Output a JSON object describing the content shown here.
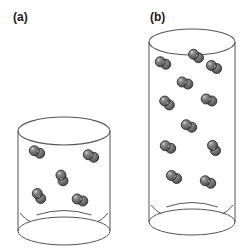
{
  "figure": {
    "title": "",
    "background_color": "#ffffff",
    "stroke_color": "#555555",
    "molecule_fill_dark": "#5f5f5f",
    "molecule_fill_light": "#8e8e8e",
    "molecule_outline": "#2b2b2b",
    "label_color": "#1a1a1a"
  },
  "panels": [
    {
      "id": "a",
      "label": "(a)",
      "name": "short-cylinder",
      "molecule_count": 5,
      "cylinder": {
        "cx": 64,
        "top_y": 131,
        "bottom_y": 231,
        "rx": 46,
        "ry": 14,
        "height": 100
      },
      "molecules": [
        {
          "x": 37,
          "y": 152,
          "angle": 25
        },
        {
          "x": 91,
          "y": 156,
          "angle": 25
        },
        {
          "x": 62,
          "y": 178,
          "angle": 70
        },
        {
          "x": 39,
          "y": 196,
          "angle": 55
        },
        {
          "x": 80,
          "y": 200,
          "angle": 20
        }
      ]
    },
    {
      "id": "b",
      "label": "(b)",
      "name": "tall-cylinder",
      "molecule_count": 11,
      "cylinder": {
        "cx": 192,
        "top_y": 42,
        "bottom_y": 222,
        "rx": 43,
        "ry": 13,
        "height": 180
      },
      "molecules": [
        {
          "x": 163,
          "y": 63,
          "angle": 25
        },
        {
          "x": 214,
          "y": 67,
          "angle": 30
        },
        {
          "x": 185,
          "y": 83,
          "angle": 20
        },
        {
          "x": 167,
          "y": 103,
          "angle": 40
        },
        {
          "x": 209,
          "y": 100,
          "angle": 20
        },
        {
          "x": 189,
          "y": 126,
          "angle": 25
        },
        {
          "x": 168,
          "y": 147,
          "angle": 25
        },
        {
          "x": 214,
          "y": 148,
          "angle": 60
        },
        {
          "x": 174,
          "y": 177,
          "angle": 30
        },
        {
          "x": 208,
          "y": 182,
          "angle": 25
        },
        {
          "x": 196,
          "y": 56,
          "angle": 35
        }
      ]
    }
  ],
  "molecule": {
    "name": "diatomic-molecule",
    "atom_radius": 5,
    "bond_offset": 6,
    "description": "two overlapping shaded spheres"
  }
}
